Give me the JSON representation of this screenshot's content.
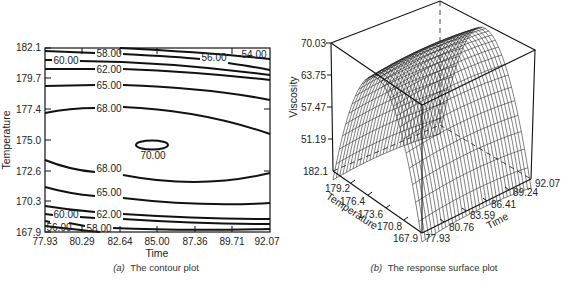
{
  "figure": {
    "left_caption_prefix": "(a)",
    "left_caption": "The contour plot",
    "right_caption_prefix": "(b)",
    "right_caption": "The response surface plot"
  },
  "chart_data": [
    {
      "type": "contour",
      "title": "The contour plot",
      "xlabel": "Time",
      "ylabel": "Temperature",
      "x_ticks": [
        "77.93",
        "80.29",
        "82.64",
        "85.00",
        "87.36",
        "89.71",
        "92.07"
      ],
      "y_ticks": [
        "182.1",
        "179.7",
        "177.4",
        "175.0",
        "172.6",
        "170.3",
        "167.9"
      ],
      "xlim": [
        77.93,
        92.07
      ],
      "ylim": [
        167.9,
        182.1
      ],
      "grid": false,
      "contour_levels": [
        {
          "level": "54.00",
          "position": "top-right corner"
        },
        {
          "level": "56.00",
          "position": "top (upper-right) and bottom-left corner"
        },
        {
          "level": "58.00",
          "position": "top and bottom"
        },
        {
          "level": "60.00",
          "position": "top-left and bottom-left"
        },
        {
          "level": "62.00",
          "position": "top and bottom"
        },
        {
          "level": "65.00",
          "position": "top and bottom"
        },
        {
          "level": "68.00",
          "position": "upper arc and lower arc"
        },
        {
          "level": "70.00",
          "position": "small closed ellipse near Time=85.0, Temperature=175.0"
        }
      ],
      "labels": {
        "c54": "54.00",
        "c56": "56.00",
        "c58": "58.00",
        "c60": "60.00",
        "c62": "62.00",
        "c65": "65.00",
        "c68": "68.00",
        "c70": "70.00"
      },
      "optimum": {
        "time": 85.0,
        "temperature": 175.0,
        "viscosity": 70.0
      }
    },
    {
      "type": "surface",
      "title": "The response surface plot",
      "xlabel": "Time",
      "ylabel": "Temperature",
      "zlabel": "Viscosity",
      "x_ticks": [
        "77.93",
        "80.76",
        "83.59",
        "86.41",
        "89.24",
        "92.07"
      ],
      "y_ticks": [
        "182.1",
        "179.2",
        "176.4",
        "173.6",
        "170.8",
        "167.9"
      ],
      "z_ticks": [
        "70.03",
        "63.75",
        "57.47",
        "51.19"
      ],
      "xlim": [
        77.93,
        92.07
      ],
      "ylim": [
        167.9,
        182.1
      ],
      "zlim": [
        51.19,
        70.03
      ],
      "grid": false,
      "style": "wireframe mesh"
    }
  ]
}
